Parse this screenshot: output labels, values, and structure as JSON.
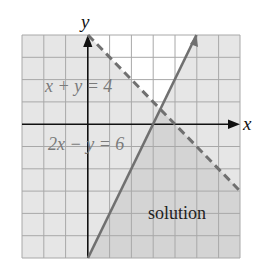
{
  "figure": {
    "axes": {
      "x_label": "x",
      "y_label": "y",
      "x_range": [
        -3,
        7
      ],
      "y_range": [
        -6,
        4
      ]
    },
    "lines": [
      {
        "label": "x + y = 4",
        "style": "dashed",
        "color": "#707070"
      },
      {
        "label": "2x − y = 6",
        "style": "solid",
        "color": "#707070"
      }
    ],
    "region_label": "solution",
    "colors": {
      "light_shade": "#e6e6e6",
      "solution_shade": "#d4d4d4",
      "unshaded": "#ffffff",
      "grid": "#a8a8a8",
      "axis": "#111111"
    }
  }
}
